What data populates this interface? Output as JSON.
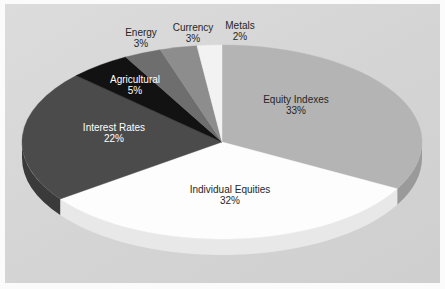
{
  "chart_data": {
    "type": "pie",
    "title": "",
    "subtitle": "",
    "xlabel": "",
    "ylabel": "",
    "legend_position": "none",
    "grid": false,
    "style": "3d-pie",
    "value_unit": "%",
    "categories": [
      "Equity Indexes",
      "Individual Equities",
      "Interest Rates",
      "Agricultural",
      "Energy",
      "Currency",
      "Metals"
    ],
    "values": [
      33,
      32,
      22,
      5,
      3,
      3,
      2
    ],
    "slices": [
      {
        "label": "Equity Indexes",
        "value": 33,
        "value_text": "33%",
        "color": "#b4b4b4",
        "side_color": "#9a9a9a",
        "label_color": "#262626",
        "label_x": 296,
        "label_y": 94
      },
      {
        "label": "Individual Equities",
        "value": 32,
        "value_text": "32%",
        "color": "#fdfdfd",
        "side_color": "#e8e8e8",
        "label_color": "#262626",
        "label_x": 230,
        "label_y": 184
      },
      {
        "label": "Interest Rates",
        "value": 22,
        "value_text": "22%",
        "color": "#4b4b4b",
        "side_color": "#3a3a3a",
        "label_color": "#ffffff",
        "label_x": 114,
        "label_y": 122
      },
      {
        "label": "Agricultural",
        "value": 5,
        "value_text": "5%",
        "color": "#121212",
        "side_color": "#0b0b0b",
        "label_color": "#ffffff",
        "label_x": 135,
        "label_y": 74
      },
      {
        "label": "Energy",
        "value": 3,
        "value_text": "3%",
        "color": "#6e6e6e",
        "side_color": "#5a5a5a",
        "label_color": "#262626",
        "label_x": 141,
        "label_y": 27
      },
      {
        "label": "Currency",
        "value": 3,
        "value_text": "3%",
        "color": "#8d8d8d",
        "side_color": "#767676",
        "label_color": "#262626",
        "label_x": 193,
        "label_y": 22
      },
      {
        "label": "Metals",
        "value": 2,
        "value_text": "2%",
        "color": "#f2f2f2",
        "side_color": "#dcdcdc",
        "label_color": "#262626",
        "label_x": 240,
        "label_y": 20
      }
    ],
    "geometry": {
      "center_x": 222,
      "center_y": 142,
      "radius_x": 200,
      "radius_y": 97,
      "depth": 16,
      "start_angle_deg": -90
    },
    "colors": {
      "background_panel": "#d8d8d8",
      "frame": "#fbfbfb"
    }
  }
}
